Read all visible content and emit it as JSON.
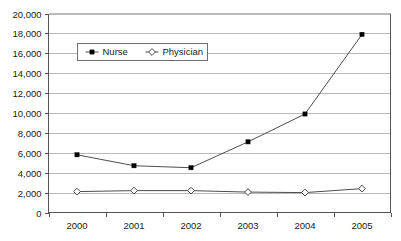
{
  "chart_data": {
    "type": "line",
    "title": "",
    "xlabel": "",
    "ylabel": "",
    "categories": [
      "2000",
      "2001",
      "2002",
      "2003",
      "2004",
      "2005"
    ],
    "series": [
      {
        "name": "Nurse",
        "marker": "filled-square",
        "values": [
          5800,
          4700,
          4500,
          7100,
          9900,
          17900
        ]
      },
      {
        "name": "Physician",
        "marker": "open-diamond",
        "values": [
          2100,
          2200,
          2200,
          2050,
          2000,
          2400
        ]
      }
    ],
    "ylim": [
      0,
      20000
    ],
    "ytick_step": 2000,
    "ytick_labels": [
      "0",
      "2,000",
      "4,000",
      "6,000",
      "8,000",
      "10,000",
      "12,000",
      "14,000",
      "16,000",
      "18,000",
      "20,000"
    ],
    "grid": "horizontal",
    "legend_position": "top-left-inside",
    "colors": {
      "gridline": "#b9b9b9",
      "axis": "#555555",
      "line": "#4d4d4d",
      "nurse_marker": "#000000",
      "physician_marker": "#ffffff",
      "background": "#ffffff",
      "text": "#1a1a1a"
    }
  }
}
